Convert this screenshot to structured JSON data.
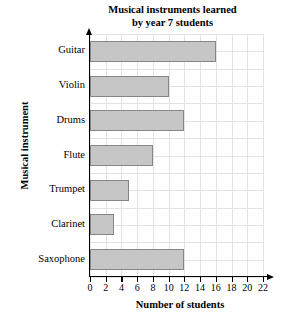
{
  "chart_data": {
    "type": "bar",
    "orientation": "horizontal",
    "title": "Musical instruments learned by year 7 students",
    "title_lines": [
      "Musical instruments learned",
      "by year 7 students"
    ],
    "xlabel": "Number of students",
    "ylabel": "Musical instrument",
    "categories": [
      "Guitar",
      "Violin",
      "Drums",
      "Flute",
      "Trumpet",
      "Clarinet",
      "Saxophone"
    ],
    "values": [
      16,
      10,
      12,
      8,
      5,
      3,
      12
    ],
    "xlim": [
      0,
      22
    ],
    "xticks": [
      0,
      2,
      4,
      6,
      8,
      10,
      12,
      14,
      16,
      18,
      20,
      22
    ],
    "xtick_labels": [
      "0",
      "2",
      "4",
      "6",
      "8",
      "10",
      "12",
      "14",
      "16",
      "18",
      "20",
      "22"
    ],
    "grid": true,
    "grid_step": 2,
    "legend": null,
    "bar_fill_color": "#c6c6c6",
    "bar_border_color": "#868686",
    "grid_color": "#e3e3e3",
    "axis_color": "#000000",
    "background_color": "#ffffff"
  }
}
